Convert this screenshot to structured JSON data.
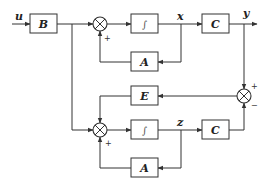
{
  "diagram": {
    "type": "block-diagram",
    "signals": {
      "input": "u",
      "plant_state": "x",
      "plant_output": "y",
      "observer_state": "z"
    },
    "blocks": {
      "b_block": "B",
      "plant_integrator": "∫",
      "plant_c": "C",
      "plant_a": "A",
      "observer_e": "E",
      "observer_integrator": "∫",
      "observer_c": "C",
      "observer_a": "A"
    },
    "signs": {
      "sum1_bottom": "+",
      "sum2_bottom": "+",
      "error_top": "+",
      "error_bottom": "−"
    },
    "colors": {
      "line": "#333333",
      "background": "#ffffff"
    }
  }
}
